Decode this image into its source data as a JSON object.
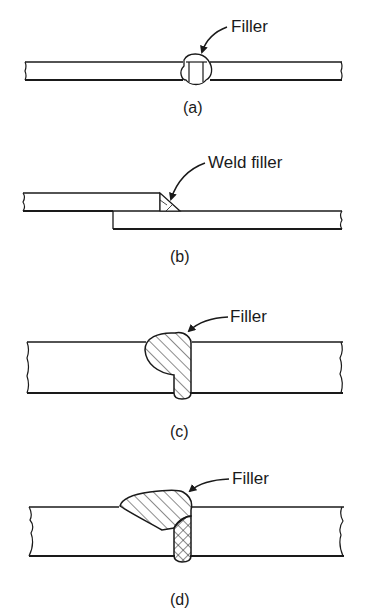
{
  "figures": [
    {
      "id": "a",
      "caption": "(a)",
      "callout": "Filler",
      "description": "Butt joint with filler bead through thin plate"
    },
    {
      "id": "b",
      "caption": "(b)",
      "callout": "Weld filler",
      "description": "Lap joint with fillet weld filler"
    },
    {
      "id": "c",
      "caption": "(c)",
      "callout": "Filler",
      "description": "Butt joint in thick plate with hatched filler"
    },
    {
      "id": "d",
      "caption": "(d)",
      "callout": "Filler",
      "description": "Butt joint in thick plate with bevel filler and cross-hatched root pass"
    }
  ],
  "colors": {
    "ink": "#1a1a1a",
    "background": "#ffffff"
  }
}
